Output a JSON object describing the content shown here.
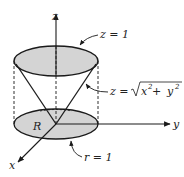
{
  "figure": {
    "axes": {
      "x_label": "x",
      "y_label": "y",
      "z_label": "z"
    },
    "labels": {
      "top_plane": "z = 1",
      "cone_eq_lhs": "z =",
      "cone_eq_x": "x",
      "cone_eq_plus": " + ",
      "cone_eq_y": "y",
      "cone_eq_exp": "2",
      "base_circle": "r = 1",
      "region": "R"
    },
    "colors": {
      "fill": "#d4d4d4",
      "stroke": "#1a1a1a",
      "background": "#ffffff"
    }
  }
}
